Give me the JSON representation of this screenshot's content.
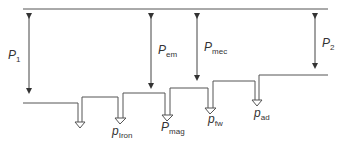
{
  "diagram": {
    "type": "power-flow-diagram",
    "colors": {
      "line": "#555555",
      "text": "#333333",
      "background": "#ffffff"
    },
    "labels": {
      "p1": {
        "main": "P",
        "sub": "1"
      },
      "pem": {
        "main": "P",
        "sub": "em"
      },
      "pmec": {
        "main": "P",
        "sub": "mec"
      },
      "p2": {
        "main": "P",
        "sub": "2"
      },
      "piron": {
        "main": "p",
        "sub": "Iron"
      },
      "pmag": {
        "main": "P",
        "sub": "mag"
      },
      "pfw": {
        "main": "p",
        "sub": "fw"
      },
      "pad": {
        "main": "p",
        "sub": "ad"
      }
    }
  }
}
